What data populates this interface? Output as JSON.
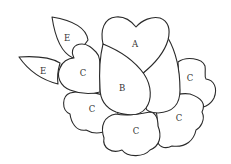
{
  "diagram": {
    "type": "appliqué pattern",
    "stroke_color": "#2a2a2a",
    "background": "#ffffff",
    "pieces": [
      {
        "id": "leaf-top",
        "label": "E"
      },
      {
        "id": "leaf-left",
        "label": "E"
      },
      {
        "id": "petal-left-heart",
        "label": "C"
      },
      {
        "id": "petal-top-heart",
        "label": "A"
      },
      {
        "id": "bud-center",
        "label": "B"
      },
      {
        "id": "petal-right-top",
        "label": "C"
      },
      {
        "id": "petal-bottom-left",
        "label": "C"
      },
      {
        "id": "petal-bottom-middle",
        "label": "C"
      },
      {
        "id": "petal-bottom-right",
        "label": "C"
      }
    ]
  }
}
